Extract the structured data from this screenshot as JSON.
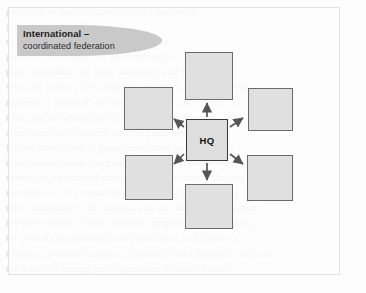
{
  "figure": {
    "banner": {
      "title": "International –",
      "subtitle": "coordinated federation"
    },
    "center_node": {
      "label": "HQ",
      "name": "headquarters"
    },
    "satellite_nodes": [
      {
        "position": "top",
        "label": ""
      },
      {
        "position": "top-left",
        "label": ""
      },
      {
        "position": "top-right",
        "label": ""
      },
      {
        "position": "bottom-left",
        "label": ""
      },
      {
        "position": "bottom-right",
        "label": ""
      },
      {
        "position": "bottom",
        "label": ""
      }
    ],
    "connections": [
      {
        "from": "HQ",
        "to": "top",
        "direction": "outward",
        "style": "solid-arrow"
      },
      {
        "from": "HQ",
        "to": "top-left",
        "direction": "outward",
        "style": "solid-arrow"
      },
      {
        "from": "HQ",
        "to": "top-right",
        "direction": "outward",
        "style": "solid-arrow"
      },
      {
        "from": "HQ",
        "to": "bottom-left",
        "direction": "outward",
        "style": "solid-arrow"
      },
      {
        "from": "HQ",
        "to": "bottom-right",
        "direction": "outward",
        "style": "solid-arrow"
      },
      {
        "from": "HQ",
        "to": "bottom",
        "direction": "outward",
        "style": "solid-arrow"
      }
    ],
    "colors": {
      "banner_fill": "#c9c9c9",
      "node_fill": "#e0e0e0",
      "node_border": "#6b6b6b",
      "hq_border": "#3a3a3a",
      "arrow": "#555555",
      "panel_background": "#fcfcfc"
    }
  },
  "background_text": {
    "lines": [
      "palatable as they are tangible; and perhaps a",
      "going - along the lines",
      "to a great degree of autonomy and the",
      "position. Moreover, the development of skills and",
      "place a premium on local autonomy and freedom at",
      "with this country the complete centrality of a much larger",
      "national to national and international an the market. In other",
      "to accept the wider role of the global corporation. The",
      "significant shift towards adopting and new thought",
      "further integration of group operations performing as",
      "international under the general heading of the devel-",
      "opment of an internal market in the structure of the one",
      "manager. In the corporate structure which is used by a",
      "more autonomy in the internal and still in not a substantial",
      "involved. Rather, these processes purposes together using",
      "the global co-ordination and production; and it adopts",
      "to secure a central position of initiative and flexibility of most",
      "the trade-off among both operations of a still further"
    ]
  }
}
